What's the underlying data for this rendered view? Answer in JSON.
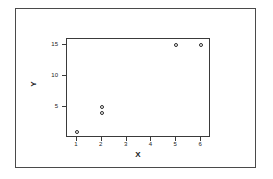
{
  "chart_data": {
    "type": "scatter",
    "title": "",
    "xlabel": "X",
    "ylabel": "Y",
    "xlim": [
      0.6,
      6.4
    ],
    "ylim": [
      0,
      15.9
    ],
    "xticks": [
      1,
      2,
      3,
      4,
      5,
      6
    ],
    "xticklabels": [
      "1",
      "2",
      "3",
      "4",
      "5",
      "6"
    ],
    "yticks": [
      5,
      10,
      15
    ],
    "yticklabels": [
      "5",
      "10",
      "15"
    ],
    "grid": false,
    "legend": null,
    "marker": "open-circle",
    "points": [
      {
        "x": 1,
        "y": 1
      },
      {
        "x": 2,
        "y": 5
      },
      {
        "x": 2,
        "y": 4
      },
      {
        "x": 5,
        "y": 15
      },
      {
        "x": 6,
        "y": 15
      }
    ],
    "series": [
      {
        "name": "",
        "x": [
          1,
          2,
          2,
          5,
          6
        ],
        "values": [
          1,
          5,
          4,
          15,
          15
        ]
      }
    ],
    "colors": {
      "marker_edge": "#2b2b2b",
      "marker_face": "#ffffff",
      "axis": "#3a3a3a",
      "border": "#4a4a4a",
      "text": "#1a1a1a",
      "background": "#ffffff"
    }
  }
}
